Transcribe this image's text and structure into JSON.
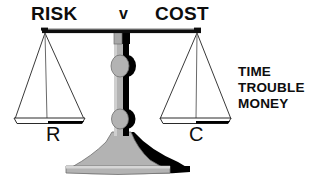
{
  "diagram": {
    "title_left": "RISK",
    "versus": "v",
    "title_right": "COST",
    "pan_left_label": "R",
    "pan_right_label": "C",
    "cost_factors": [
      "TIME",
      "TROUBLE",
      "MONEY"
    ],
    "icon_names": {
      "scale": "balance-scale-icon",
      "beam": "scale-beam",
      "pan_left": "scale-pan-left",
      "pan_right": "scale-pan-right",
      "column": "scale-column",
      "base": "scale-base"
    },
    "colors": {
      "ink": "#0d0d0d",
      "shadow": "#000000",
      "metal_light": "#b3b3b3",
      "metal_mid": "#9a9a9a",
      "background": "#ffffff",
      "hairline": "#3a3a3a"
    }
  }
}
